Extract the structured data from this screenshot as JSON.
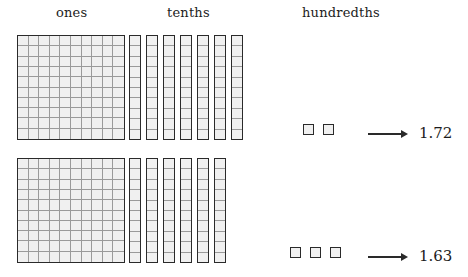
{
  "diagram": {
    "title_labels": {
      "ones": "ones",
      "tenths": "tenths",
      "hundredths": "hundredths"
    },
    "rows": [
      {
        "id": "row-1",
        "ones_count": 1,
        "tenths_count": 7,
        "hundredths_count": 2,
        "value": "1.72"
      },
      {
        "id": "row-2",
        "ones_count": 1,
        "tenths_count": 6,
        "hundredths_count": 3,
        "value": "1.63"
      }
    ],
    "colors": {
      "outline": "#2a2a2a",
      "gridline": "#9a9a9a",
      "fill": "#f0f0f0",
      "background": "#ffffff",
      "text": "#1c1c1c"
    },
    "grid": {
      "flat_rows": 10,
      "flat_cols": 10,
      "rod_units": 10
    }
  },
  "chart_data": {
    "type": "table",
    "categories": [
      "ones",
      "tenths",
      "hundredths"
    ],
    "series": [
      {
        "name": "1.72",
        "values": [
          1,
          7,
          2
        ]
      },
      {
        "name": "1.63",
        "values": [
          1,
          6,
          3
        ]
      }
    ]
  }
}
